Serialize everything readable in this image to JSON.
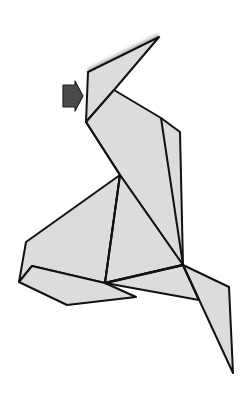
{
  "diagram": {
    "type": "origami-folding-diagram",
    "colors": {
      "background": "#ffffff",
      "paper_fill": "#dcdcdc",
      "fold_line": "#111111",
      "arrow_fill": "#4a4a4a",
      "arrow_stroke": "#222222",
      "shadow": "#b8b8b8"
    },
    "annotations": [
      {
        "kind": "push-arrow",
        "direction": "right",
        "target": "neck-left-edge"
      }
    ]
  }
}
